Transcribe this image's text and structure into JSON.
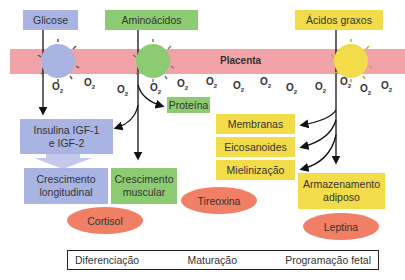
{
  "diagram": {
    "placenta_label": "Placenta",
    "nutrients": [
      {
        "label": "Glicose",
        "color": "#a9b4e3"
      },
      {
        "label": "Aminoácidos",
        "color": "#8dcb72"
      },
      {
        "label": "Ácidos graxos",
        "color": "#f3dc4a"
      }
    ],
    "oxygen": {
      "symbol": "O",
      "subscript": "2",
      "count": 14
    },
    "outputs": {
      "proteina": "Proteína",
      "insulina_line1": "Insulina IGF-1",
      "insulina_line2": "e IGF-2",
      "crescimento_longitudinal_line1": "Crescimento",
      "crescimento_longitudinal_line2": "longitudinal",
      "crescimento_muscular_line1": "Crescimento",
      "crescimento_muscular_line2": "muscular",
      "membranas": "Membranas",
      "eicosanoides": "Eicosanoides",
      "mielinizacao": "Mielinização",
      "armazenamento_line1": "Armazenamento",
      "armazenamento_line2": "adiposo"
    },
    "hormones": [
      "Cortisol",
      "Tireoxina",
      "Leptina"
    ],
    "hormone_color": "#f17f66",
    "legend": [
      "Diferenciação",
      "Maturação",
      "Programação fetal"
    ],
    "band_color": "#f2a3a8"
  }
}
